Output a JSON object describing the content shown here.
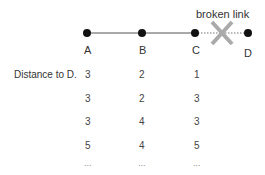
{
  "diagram": {
    "nodes": [
      {
        "id": "A",
        "label": "A"
      },
      {
        "id": "B",
        "label": "B"
      },
      {
        "id": "C",
        "label": "C"
      },
      {
        "id": "D",
        "label": "D"
      }
    ],
    "links": [
      {
        "from": "A",
        "to": "B",
        "status": "ok"
      },
      {
        "from": "B",
        "to": "C",
        "status": "ok"
      },
      {
        "from": "C",
        "to": "D",
        "status": "broken"
      }
    ],
    "broken_link_label": "broken link",
    "colors": {
      "node": "#111111",
      "line": "#555555",
      "cross": "#aaaaaa"
    }
  },
  "table": {
    "row_label": "Distance to D.",
    "columns": [
      "A",
      "B",
      "C"
    ],
    "rows": [
      [
        "3",
        "2",
        "1"
      ],
      [
        "3",
        "2",
        "3"
      ],
      [
        "3",
        "4",
        "3"
      ],
      [
        "5",
        "4",
        "5"
      ],
      [
        "...",
        "...",
        "..."
      ]
    ]
  }
}
